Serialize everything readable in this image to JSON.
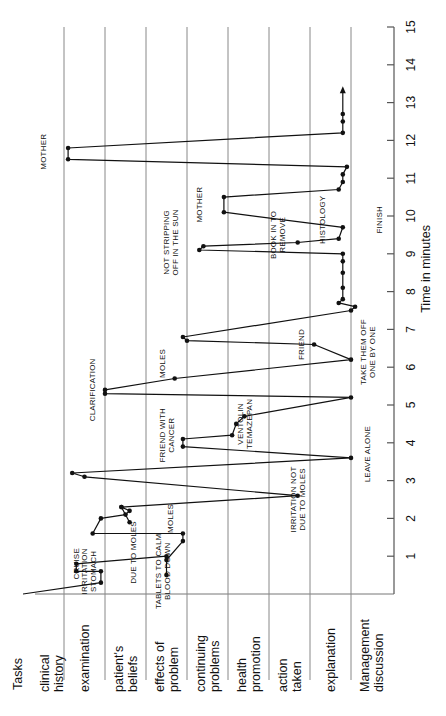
{
  "chart_data": {
    "type": "line",
    "title": "",
    "orientation": "rotated-90-ccw",
    "xlabel": "Time in minutes",
    "ylabel": "Tasks",
    "xlim": [
      0,
      15
    ],
    "x_ticks": [
      1,
      2,
      3,
      4,
      5,
      6,
      7,
      8,
      9,
      10,
      11,
      12,
      13,
      14,
      15
    ],
    "grid": "row separators only",
    "categories_header": "Tasks",
    "categories": [
      "clinical history",
      "examination",
      "patient's beliefs",
      "effects of problem",
      "continuing problems",
      "health promotion",
      "action taken",
      "explanation",
      "Management discussion"
    ],
    "category_labels": [
      [
        "clinical",
        "history"
      ],
      [
        "examination"
      ],
      [
        "patient's",
        "beliefs"
      ],
      [
        "effects of",
        "problem"
      ],
      [
        "continuing",
        "problems"
      ],
      [
        "health",
        "promotion"
      ],
      [
        "action",
        "taken"
      ],
      [
        "explanation"
      ],
      [
        "Management",
        "discussion"
      ]
    ],
    "series": [
      {
        "name": "consultation path",
        "points": [
          {
            "t": 0.0,
            "task": 0.0
          },
          {
            "t": 0.3,
            "task": 1.9
          },
          {
            "t": 0.6,
            "task": 1.9
          },
          {
            "t": 0.6,
            "task": 1.3
          },
          {
            "t": 0.8,
            "task": 1.3
          },
          {
            "t": 1.0,
            "task": 3.5
          },
          {
            "t": 0.5,
            "task": 3.5
          },
          {
            "t": 0.9,
            "task": 3.5
          },
          {
            "t": 1.4,
            "task": 3.9
          },
          {
            "t": 1.6,
            "task": 3.9
          },
          {
            "t": 1.6,
            "task": 1.7
          },
          {
            "t": 2.0,
            "task": 1.9
          },
          {
            "t": 2.1,
            "task": 2.5
          },
          {
            "t": 2.2,
            "task": 2.6
          },
          {
            "t": 2.3,
            "task": 2.4
          },
          {
            "t": 1.9,
            "task": 2.6
          },
          {
            "t": 2.3,
            "task": 2.4
          },
          {
            "t": 2.6,
            "task": 6.7
          },
          {
            "t": 3.1,
            "task": 1.5
          },
          {
            "t": 3.2,
            "task": 1.2
          },
          {
            "t": 3.6,
            "task": 8.0
          },
          {
            "t": 3.9,
            "task": 3.9
          },
          {
            "t": 4.1,
            "task": 3.9
          },
          {
            "t": 4.2,
            "task": 5.1
          },
          {
            "t": 4.5,
            "task": 5.2
          },
          {
            "t": 4.7,
            "task": 5.4
          },
          {
            "t": 5.2,
            "task": 8.0
          },
          {
            "t": 5.3,
            "task": 2.0
          },
          {
            "t": 5.4,
            "task": 2.0
          },
          {
            "t": 5.7,
            "task": 3.7
          },
          {
            "t": 6.2,
            "task": 8.0
          },
          {
            "t": 6.6,
            "task": 7.1
          },
          {
            "t": 6.7,
            "task": 4.0
          },
          {
            "t": 6.8,
            "task": 3.9
          },
          {
            "t": 7.5,
            "task": 8.0
          },
          {
            "t": 7.6,
            "task": 8.1
          },
          {
            "t": 7.7,
            "task": 7.7
          },
          {
            "t": 7.8,
            "task": 7.8
          },
          {
            "t": 8.1,
            "task": 7.8
          },
          {
            "t": 8.5,
            "task": 7.8
          },
          {
            "t": 8.8,
            "task": 7.8
          },
          {
            "t": 9.0,
            "task": 7.8
          },
          {
            "t": 9.1,
            "task": 4.3
          },
          {
            "t": 9.2,
            "task": 4.4
          },
          {
            "t": 9.3,
            "task": 6.7
          },
          {
            "t": 9.4,
            "task": 7.7
          },
          {
            "t": 9.7,
            "task": 7.8
          },
          {
            "t": 10.1,
            "task": 4.9
          },
          {
            "t": 10.5,
            "task": 4.9
          },
          {
            "t": 10.7,
            "task": 7.7
          },
          {
            "t": 10.9,
            "task": 7.8
          },
          {
            "t": 11.1,
            "task": 7.8
          },
          {
            "t": 11.3,
            "task": 7.9
          },
          {
            "t": 11.5,
            "task": 1.1
          },
          {
            "t": 11.8,
            "task": 1.1
          },
          {
            "t": 12.2,
            "task": 7.8
          },
          {
            "t": 12.5,
            "task": 7.8
          },
          {
            "t": 12.7,
            "task": 7.8
          }
        ]
      }
    ],
    "annotations": [
      {
        "text": "CRUISE",
        "t": 0.8,
        "task": 1.3
      },
      {
        "text": "IRRITATION STOMACH",
        "t": 0.6,
        "task": 1.5
      },
      {
        "text": "TABLETS TO CALM BLOOD DOWN",
        "t": 0.6,
        "task": 3.3
      },
      {
        "text": "DUE TO MOLES",
        "t": 1.1,
        "task": 2.7
      },
      {
        "text": "MOLES",
        "t": 2.0,
        "task": 3.6
      },
      {
        "text": "IRRITATION NOT DUE TO MOLES",
        "t": 2.5,
        "task": 6.6
      },
      {
        "text": "LEAVE ALONE",
        "t": 3.7,
        "task": 8.4
      },
      {
        "text": "FRIEND WITH CANCER",
        "t": 4.2,
        "task": 3.4
      },
      {
        "text": "VENTOLIN TEMAZEPAN",
        "t": 4.5,
        "task": 5.3
      },
      {
        "text": "CLARIFICATION",
        "t": 5.4,
        "task": 1.7
      },
      {
        "text": "MOLES",
        "t": 6.1,
        "task": 3.4
      },
      {
        "text": "FRIEND",
        "t": 6.6,
        "task": 6.8
      },
      {
        "text": "TAKE THEM OFF ONE BY ONE",
        "t": 6.4,
        "task": 8.3
      },
      {
        "text": "NOT STRIPPING OFF IN THE SUN",
        "t": 9.3,
        "task": 3.5
      },
      {
        "text": "BOOK IN TO REMOVE",
        "t": 9.5,
        "task": 6.1
      },
      {
        "text": "HISTOLOGY",
        "t": 9.9,
        "task": 7.3
      },
      {
        "text": "FINISH",
        "t": 9.9,
        "task": 8.7
      },
      {
        "text": "MOTHER",
        "t": 10.3,
        "task": 4.3
      },
      {
        "text": "MOTHER",
        "t": 11.7,
        "task": 0.5
      }
    ],
    "end_arrow": {
      "from_t": 12.7,
      "to_t": 13.3,
      "task": 7.8
    }
  }
}
